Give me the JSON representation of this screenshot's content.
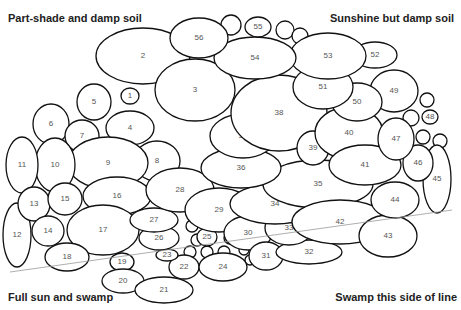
{
  "zones": {
    "top_left": "Part-shade and damp soil",
    "top_right": "Sunshine but damp soil",
    "bottom_left": "Full sun and swamp",
    "bottom_right": "Swamp this side of line"
  },
  "beds": [
    {
      "n": "1",
      "cx": 130,
      "cy": 96,
      "rx": 9,
      "ry": 8
    },
    {
      "n": "2",
      "cx": 143,
      "cy": 56,
      "rx": 47,
      "ry": 28
    },
    {
      "n": "3",
      "cx": 195,
      "cy": 90,
      "rx": 40,
      "ry": 31
    },
    {
      "n": "4",
      "cx": 130,
      "cy": 128,
      "rx": 24,
      "ry": 17
    },
    {
      "n": "5",
      "cx": 94,
      "cy": 102,
      "rx": 17,
      "ry": 18
    },
    {
      "n": "6",
      "cx": 51,
      "cy": 124,
      "rx": 18,
      "ry": 20
    },
    {
      "n": "7",
      "cx": 82,
      "cy": 136,
      "rx": 17,
      "ry": 16
    },
    {
      "n": "8",
      "cx": 157,
      "cy": 161,
      "rx": 23,
      "ry": 20
    },
    {
      "n": "9",
      "cx": 108,
      "cy": 163,
      "rx": 40,
      "ry": 26
    },
    {
      "n": "10",
      "cx": 55,
      "cy": 165,
      "rx": 20,
      "ry": 27
    },
    {
      "n": "11",
      "cx": 22,
      "cy": 165,
      "rx": 16,
      "ry": 28
    },
    {
      "n": "12",
      "cx": 17,
      "cy": 235,
      "rx": 14,
      "ry": 32
    },
    {
      "n": "13",
      "cx": 34,
      "cy": 204,
      "rx": 16,
      "ry": 17
    },
    {
      "n": "14",
      "cx": 48,
      "cy": 231,
      "rx": 16,
      "ry": 15
    },
    {
      "n": "15",
      "cx": 65,
      "cy": 199,
      "rx": 17,
      "ry": 16
    },
    {
      "n": "16",
      "cx": 117,
      "cy": 196,
      "rx": 34,
      "ry": 19
    },
    {
      "n": "17",
      "cx": 103,
      "cy": 230,
      "rx": 36,
      "ry": 25
    },
    {
      "n": "18",
      "cx": 67,
      "cy": 257,
      "rx": 22,
      "ry": 14
    },
    {
      "n": "19",
      "cx": 122,
      "cy": 262,
      "rx": 12,
      "ry": 9
    },
    {
      "n": "20",
      "cx": 123,
      "cy": 281,
      "rx": 21,
      "ry": 12
    },
    {
      "n": "21",
      "cx": 164,
      "cy": 290,
      "rx": 29,
      "ry": 13
    },
    {
      "n": "22",
      "cx": 184,
      "cy": 267,
      "rx": 15,
      "ry": 12
    },
    {
      "n": "23",
      "cx": 167,
      "cy": 255,
      "rx": 11,
      "ry": 6
    },
    {
      "n": "24",
      "cx": 223,
      "cy": 267,
      "rx": 24,
      "ry": 14
    },
    {
      "n": "25",
      "cx": 207,
      "cy": 237,
      "rx": 10,
      "ry": 9
    },
    {
      "n": "26",
      "cx": 159,
      "cy": 238,
      "rx": 20,
      "ry": 12
    },
    {
      "n": "27",
      "cx": 154,
      "cy": 220,
      "rx": 24,
      "ry": 12
    },
    {
      "n": "28",
      "cx": 180,
      "cy": 190,
      "rx": 34,
      "ry": 22
    },
    {
      "n": "29",
      "cx": 219,
      "cy": 210,
      "rx": 34,
      "ry": 22
    },
    {
      "n": "30",
      "cx": 248,
      "cy": 233,
      "rx": 24,
      "ry": 17
    },
    {
      "n": "31",
      "cx": 266,
      "cy": 256,
      "rx": 17,
      "ry": 14
    },
    {
      "n": "32",
      "cx": 309,
      "cy": 252,
      "rx": 33,
      "ry": 12
    },
    {
      "n": "33",
      "cx": 289,
      "cy": 228,
      "rx": 24,
      "ry": 17
    },
    {
      "n": "34",
      "cx": 275,
      "cy": 204,
      "rx": 45,
      "ry": 20
    },
    {
      "n": "35",
      "cx": 318,
      "cy": 184,
      "rx": 55,
      "ry": 24
    },
    {
      "n": "36",
      "cx": 241,
      "cy": 168,
      "rx": 40,
      "ry": 20
    },
    {
      "n": "37",
      "cx": 243,
      "cy": 136,
      "rx": 33,
      "ry": 22
    },
    {
      "n": "38",
      "cx": 279,
      "cy": 113,
      "rx": 48,
      "ry": 38
    },
    {
      "n": "39",
      "cx": 313,
      "cy": 148,
      "rx": 16,
      "ry": 17
    },
    {
      "n": "40",
      "cx": 349,
      "cy": 133,
      "rx": 34,
      "ry": 26
    },
    {
      "n": "41",
      "cx": 365,
      "cy": 165,
      "rx": 36,
      "ry": 20
    },
    {
      "n": "42",
      "cx": 340,
      "cy": 222,
      "rx": 48,
      "ry": 22
    },
    {
      "n": "43",
      "cx": 388,
      "cy": 236,
      "rx": 29,
      "ry": 21
    },
    {
      "n": "44",
      "cx": 395,
      "cy": 200,
      "rx": 24,
      "ry": 18
    },
    {
      "n": "45",
      "cx": 437,
      "cy": 179,
      "rx": 14,
      "ry": 34
    },
    {
      "n": "46",
      "cx": 418,
      "cy": 163,
      "rx": 15,
      "ry": 18
    },
    {
      "n": "47",
      "cx": 396,
      "cy": 139,
      "rx": 18,
      "ry": 21
    },
    {
      "n": "48",
      "cx": 430,
      "cy": 117,
      "rx": 8,
      "ry": 7
    },
    {
      "n": "49",
      "cx": 394,
      "cy": 91,
      "rx": 24,
      "ry": 21
    },
    {
      "n": "50",
      "cx": 357,
      "cy": 102,
      "rx": 25,
      "ry": 19
    },
    {
      "n": "51",
      "cx": 323,
      "cy": 87,
      "rx": 30,
      "ry": 22
    },
    {
      "n": "52",
      "cx": 375,
      "cy": 55,
      "rx": 22,
      "ry": 13
    },
    {
      "n": "53",
      "cx": 328,
      "cy": 56,
      "rx": 38,
      "ry": 23
    },
    {
      "n": "54",
      "cx": 255,
      "cy": 58,
      "rx": 41,
      "ry": 21
    },
    {
      "n": "55",
      "cx": 258,
      "cy": 27,
      "rx": 13,
      "ry": 10
    },
    {
      "n": "56",
      "cx": 199,
      "cy": 38,
      "rx": 29,
      "ry": 20
    }
  ],
  "small_circles": [
    {
      "cx": 231,
      "cy": 25,
      "r": 10
    },
    {
      "cx": 285,
      "cy": 30,
      "r": 9
    },
    {
      "cx": 300,
      "cy": 36,
      "r": 8
    },
    {
      "cx": 427,
      "cy": 100,
      "r": 7
    },
    {
      "cx": 411,
      "cy": 118,
      "r": 8
    },
    {
      "cx": 423,
      "cy": 137,
      "r": 7
    },
    {
      "cx": 440,
      "cy": 141,
      "r": 7
    },
    {
      "cx": 192,
      "cy": 226,
      "r": 6
    },
    {
      "cx": 197,
      "cy": 240,
      "r": 6
    },
    {
      "cx": 230,
      "cy": 238,
      "r": 6
    },
    {
      "cx": 224,
      "cy": 252,
      "r": 6
    },
    {
      "cx": 207,
      "cy": 252,
      "r": 6
    },
    {
      "cx": 244,
      "cy": 250,
      "r": 5
    },
    {
      "cx": 190,
      "cy": 252,
      "r": 6
    },
    {
      "cx": 250,
      "cy": 260,
      "r": 5
    }
  ],
  "swamp_line": {
    "x1": 10,
    "y1": 272,
    "x2": 452,
    "y2": 210
  }
}
